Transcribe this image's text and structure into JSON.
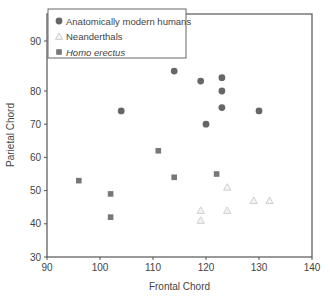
{
  "chart_data": {
    "type": "scatter",
    "title": "",
    "xlabel": "Frontal Chord",
    "ylabel": "Parietal Chord",
    "xlim": [
      90,
      140
    ],
    "ylim": [
      30,
      95
    ],
    "x_ticks": [
      90,
      100,
      110,
      120,
      130,
      140
    ],
    "y_ticks": [
      30,
      40,
      50,
      60,
      70,
      80,
      90
    ],
    "grid": false,
    "legend_position": "upper left",
    "series": [
      {
        "name": "Anatomically modern humans",
        "marker": "circle",
        "color": "#666666",
        "italic": false,
        "points": [
          [
            114,
            86
          ],
          [
            119,
            83
          ],
          [
            123,
            84
          ],
          [
            123,
            80
          ],
          [
            123,
            75
          ],
          [
            104,
            74
          ],
          [
            120,
            70
          ],
          [
            130,
            74
          ]
        ]
      },
      {
        "name": "Neanderthals",
        "marker": "triangle",
        "color": "#c8c8c8",
        "italic": false,
        "points": [
          [
            119,
            44
          ],
          [
            119,
            41
          ],
          [
            124,
            51
          ],
          [
            124,
            44
          ],
          [
            129,
            47
          ],
          [
            132,
            47
          ]
        ]
      },
      {
        "name": "Homo erectus",
        "marker": "square",
        "color": "#777777",
        "italic": true,
        "points": [
          [
            111,
            62
          ],
          [
            96,
            53
          ],
          [
            114,
            54
          ],
          [
            122,
            55
          ],
          [
            102,
            49
          ],
          [
            102,
            42
          ]
        ]
      }
    ]
  }
}
